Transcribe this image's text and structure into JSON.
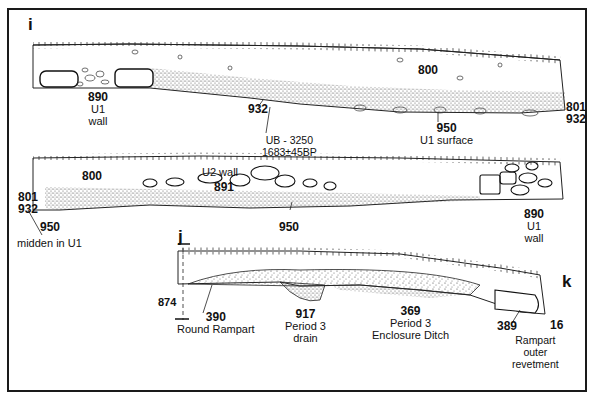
{
  "figure": {
    "type": "archaeological section drawing",
    "section_labels": {
      "i": "i",
      "j": "j",
      "k": "k"
    },
    "upper_section": {
      "labels": {
        "l890": {
          "number": "890",
          "line1": "U1",
          "line2": "wall"
        },
        "l932": {
          "number": "932"
        },
        "dating": {
          "line1": "UB - 3250",
          "line2": "1683±45BP"
        },
        "l800": {
          "number": "800"
        },
        "l950": {
          "number": "950",
          "line1": "U1 surface"
        },
        "l801": {
          "number": "801"
        },
        "l932b": {
          "number": "932"
        }
      }
    },
    "middle_section": {
      "labels": {
        "l800": {
          "number": "800"
        },
        "u2wall": {
          "text": "U2 wall"
        },
        "l891": {
          "number": "891"
        },
        "l801": {
          "number": "801"
        },
        "l932": {
          "number": "932"
        },
        "l950a": {
          "number": "950"
        },
        "midden": {
          "text": "midden in U1"
        },
        "l950b": {
          "number": "950"
        },
        "l890": {
          "number": "890",
          "line1": "U1",
          "line2": "wall"
        }
      }
    },
    "lower_section": {
      "labels": {
        "l874": {
          "number": "874"
        },
        "l390": {
          "number": "390",
          "line1": "Round Rampart"
        },
        "l917": {
          "number": "917",
          "line1": "Period 3",
          "line2": "drain"
        },
        "l369": {
          "number": "369",
          "line1": "Period 3",
          "line2": "Enclosure Ditch"
        },
        "l389": {
          "number": "389"
        },
        "l16": {
          "number": "16"
        },
        "revetment": {
          "line1": "Rampart",
          "line2": "outer",
          "line3": "revetment"
        }
      }
    },
    "colors": {
      "ink": "#111111",
      "background": "#ffffff",
      "stipple": "#555555"
    }
  }
}
